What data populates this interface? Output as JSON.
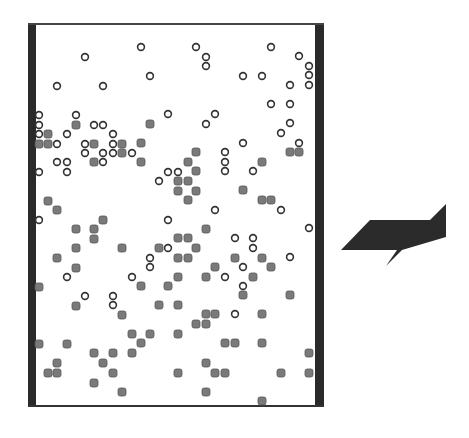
{
  "diagram": {
    "type": "particle-container",
    "colors": {
      "wall": "#2a2a2a",
      "open_particle_stroke": "#333333",
      "open_particle_fill": "#ffffff",
      "filled_particle_fill": "#7a7a7a",
      "filled_particle_stroke": "#555555",
      "arrow": "#2b2b2b"
    },
    "open_particles": [
      [
        141,
        47
      ],
      [
        196,
        47
      ],
      [
        271,
        47
      ],
      [
        85,
        57
      ],
      [
        206,
        57
      ],
      [
        206,
        66
      ],
      [
        299,
        56
      ],
      [
        309,
        66
      ],
      [
        309,
        75
      ],
      [
        309,
        85
      ],
      [
        150,
        76
      ],
      [
        243,
        76
      ],
      [
        262,
        76
      ],
      [
        290,
        85
      ],
      [
        57,
        86
      ],
      [
        103,
        86
      ],
      [
        271,
        104
      ],
      [
        290,
        104
      ],
      [
        39,
        115
      ],
      [
        76,
        115
      ],
      [
        168,
        114
      ],
      [
        215,
        114
      ],
      [
        206,
        124
      ],
      [
        290,
        123
      ],
      [
        39,
        125
      ],
      [
        94,
        125
      ],
      [
        103,
        125
      ],
      [
        39,
        134
      ],
      [
        67,
        134
      ],
      [
        113,
        134
      ],
      [
        281,
        133
      ],
      [
        57,
        144
      ],
      [
        85,
        144
      ],
      [
        113,
        144
      ],
      [
        243,
        143
      ],
      [
        299,
        143
      ],
      [
        85,
        153
      ],
      [
        103,
        153
      ],
      [
        113,
        153
      ],
      [
        132,
        153
      ],
      [
        225,
        152
      ],
      [
        57,
        162
      ],
      [
        67,
        162
      ],
      [
        103,
        162
      ],
      [
        225,
        162
      ],
      [
        39,
        172
      ],
      [
        67,
        172
      ],
      [
        168,
        172
      ],
      [
        178,
        172
      ],
      [
        225,
        171
      ],
      [
        253,
        171
      ],
      [
        159,
        181
      ],
      [
        215,
        210
      ],
      [
        281,
        210
      ],
      [
        39,
        220
      ],
      [
        168,
        220
      ],
      [
        309,
        228
      ],
      [
        235,
        238
      ],
      [
        253,
        238
      ],
      [
        168,
        248
      ],
      [
        253,
        248
      ],
      [
        150,
        258
      ],
      [
        290,
        257
      ],
      [
        150,
        267
      ],
      [
        243,
        267
      ],
      [
        67,
        277
      ],
      [
        132,
        277
      ],
      [
        225,
        277
      ],
      [
        243,
        286
      ],
      [
        85,
        296
      ],
      [
        113,
        296
      ],
      [
        113,
        305
      ],
      [
        235,
        314
      ]
    ],
    "filled_particles": [
      [
        76,
        125
      ],
      [
        150,
        124
      ],
      [
        48,
        134
      ],
      [
        39,
        144
      ],
      [
        48,
        144
      ],
      [
        94,
        144
      ],
      [
        122,
        144
      ],
      [
        141,
        143
      ],
      [
        122,
        153
      ],
      [
        94,
        162
      ],
      [
        141,
        162
      ],
      [
        196,
        152
      ],
      [
        290,
        152
      ],
      [
        299,
        152
      ],
      [
        188,
        162
      ],
      [
        262,
        162
      ],
      [
        196,
        171
      ],
      [
        178,
        181
      ],
      [
        188,
        181
      ],
      [
        178,
        191
      ],
      [
        196,
        191
      ],
      [
        243,
        190
      ],
      [
        188,
        200
      ],
      [
        262,
        200
      ],
      [
        271,
        200
      ],
      [
        48,
        201
      ],
      [
        57,
        210
      ],
      [
        103,
        220
      ],
      [
        76,
        229
      ],
      [
        94,
        229
      ],
      [
        206,
        229
      ],
      [
        94,
        239
      ],
      [
        178,
        238
      ],
      [
        188,
        238
      ],
      [
        76,
        248
      ],
      [
        122,
        248
      ],
      [
        159,
        248
      ],
      [
        196,
        248
      ],
      [
        57,
        258
      ],
      [
        178,
        258
      ],
      [
        188,
        258
      ],
      [
        235,
        258
      ],
      [
        262,
        258
      ],
      [
        76,
        268
      ],
      [
        215,
        267
      ],
      [
        271,
        267
      ],
      [
        39,
        287
      ],
      [
        141,
        286
      ],
      [
        168,
        286
      ],
      [
        178,
        277
      ],
      [
        206,
        277
      ],
      [
        253,
        277
      ],
      [
        243,
        295
      ],
      [
        290,
        295
      ],
      [
        76,
        306
      ],
      [
        159,
        305
      ],
      [
        178,
        305
      ],
      [
        122,
        315
      ],
      [
        206,
        314
      ],
      [
        215,
        314
      ],
      [
        262,
        314
      ],
      [
        196,
        324
      ],
      [
        206,
        324
      ],
      [
        132,
        334
      ],
      [
        150,
        334
      ],
      [
        178,
        334
      ],
      [
        39,
        344
      ],
      [
        67,
        344
      ],
      [
        141,
        343
      ],
      [
        225,
        343
      ],
      [
        235,
        343
      ],
      [
        262,
        343
      ],
      [
        94,
        353
      ],
      [
        113,
        353
      ],
      [
        132,
        353
      ],
      [
        309,
        353
      ],
      [
        57,
        363
      ],
      [
        103,
        363
      ],
      [
        206,
        363
      ],
      [
        48,
        373
      ],
      [
        57,
        373
      ],
      [
        113,
        373
      ],
      [
        178,
        373
      ],
      [
        215,
        373
      ],
      [
        225,
        373
      ],
      [
        281,
        373
      ],
      [
        309,
        373
      ],
      [
        94,
        383
      ],
      [
        122,
        392
      ],
      [
        206,
        392
      ],
      [
        262,
        401
      ]
    ],
    "arrow_points": "341,250 370,220 430,220 446,204 446,237 402,250 386,266 397,250",
    "arrow_direction": "right"
  }
}
